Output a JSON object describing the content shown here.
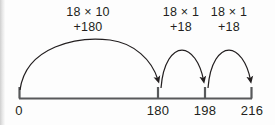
{
  "figure": {
    "type": "number-line-jump-diagram",
    "ink_color": "#231f20",
    "line_color": "#58595b",
    "background_color": "#fdfdfd"
  },
  "axis": {
    "ticks": [
      {
        "label": "0",
        "value": 0
      },
      {
        "label": "180",
        "value": 180
      },
      {
        "label": "198",
        "value": 198
      },
      {
        "label": "216",
        "value": 216
      }
    ]
  },
  "jumps": [
    {
      "operation": "18 × 10",
      "addend": "+180",
      "from": "0",
      "to": "180"
    },
    {
      "operation": "18 × 1",
      "addend": "+18",
      "from": "180",
      "to": "198"
    },
    {
      "operation": "18 × 1",
      "addend": "+18",
      "from": "198",
      "to": "216"
    }
  ]
}
